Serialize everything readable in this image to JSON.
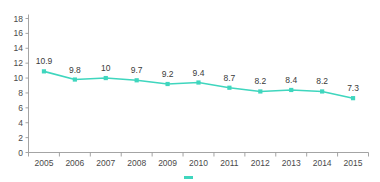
{
  "chart_data": {
    "type": "line",
    "title": "",
    "subtitle": "",
    "xlabel": "",
    "ylabel": "",
    "categories": [
      "2005",
      "2006",
      "2007",
      "2008",
      "2009",
      "2010",
      "2011",
      "2012",
      "2013",
      "2014",
      "2015"
    ],
    "values": [
      10.9,
      9.8,
      10,
      9.7,
      9.2,
      9.4,
      8.7,
      8.2,
      8.4,
      8.2,
      7.3
    ],
    "point_labels": [
      "10.9",
      "9.8",
      "10",
      "9.7",
      "9.2",
      "9.4",
      "8.7",
      "8.2",
      "8.4",
      "8.2",
      "7.3"
    ],
    "ylim": [
      0,
      18
    ],
    "ytick_values": [
      0,
      2,
      4,
      6,
      8,
      10,
      12,
      14,
      16,
      18
    ],
    "ytick_labels": [
      "0",
      "2",
      "4",
      "6",
      "8",
      "10",
      "12",
      "14",
      "16",
      "18"
    ],
    "grid": false,
    "legend": false,
    "legend_position": "none",
    "series_color": "#3FD6BE",
    "axis_color": "#9A9A9A",
    "text_color": "#3A3A3A",
    "background_color": "#FFFFFF",
    "marker": "square",
    "data_labels_shown": true
  },
  "caption": {
    "legend_swatch_color": "#3FD6BE",
    "text": ""
  }
}
